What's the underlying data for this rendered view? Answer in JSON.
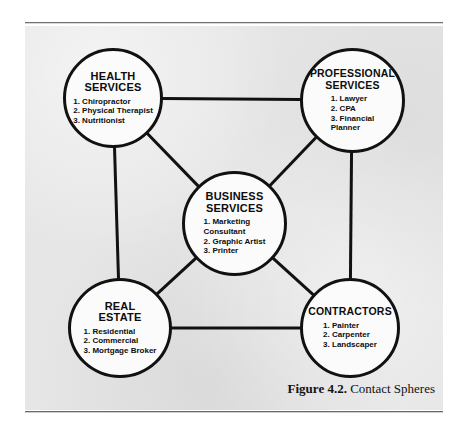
{
  "figure": {
    "caption_label": "Figure 4.2.",
    "caption_title": "Contact Spheres",
    "background_color": "#e6e6e6",
    "line_color": "#111111",
    "node_fill_color": "#fbfbfb"
  },
  "diagram": {
    "type": "network",
    "nodes": [
      {
        "id": "health",
        "title": "HEALTH\nSERVICES",
        "items": [
          "1. Chiropractor",
          "2. Physical Therapist",
          "3. Nutritionist"
        ],
        "cx": 113,
        "cy": 98,
        "r": 50
      },
      {
        "id": "professional",
        "title": "PROFESSIONAL\nSERVICES",
        "items": [
          "1. Lawyer",
          "2. CPA",
          "3. Financial\n     Planner"
        ],
        "cx": 352,
        "cy": 100,
        "r": 52
      },
      {
        "id": "business",
        "title": "BUSINESS\nSERVICES",
        "items": [
          "1. Marketing\n       Consultant",
          "2. Graphic Artist",
          "3. Printer"
        ],
        "cx": 234,
        "cy": 223,
        "r": 52
      },
      {
        "id": "realestate",
        "title": "REAL\nESTATE",
        "items": [
          "1. Residential",
          "2. Commercial",
          "3. Mortgage Broker"
        ],
        "cx": 120,
        "cy": 328,
        "r": 50
      },
      {
        "id": "contractors",
        "title": "CONTRACTORS",
        "items": [
          "1. Painter",
          "2. Carpenter",
          "3. Landscaper"
        ],
        "cx": 350,
        "cy": 328,
        "r": 50
      }
    ],
    "edges": [
      {
        "from": "health",
        "to": "professional"
      },
      {
        "from": "health",
        "to": "realestate"
      },
      {
        "from": "professional",
        "to": "contractors"
      },
      {
        "from": "realestate",
        "to": "contractors"
      },
      {
        "from": "health",
        "to": "business"
      },
      {
        "from": "professional",
        "to": "business"
      },
      {
        "from": "realestate",
        "to": "business"
      },
      {
        "from": "contractors",
        "to": "business"
      }
    ]
  }
}
